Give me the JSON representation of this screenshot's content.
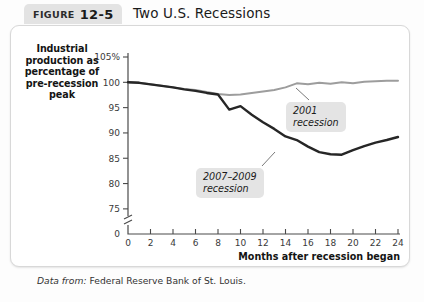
{
  "figure": {
    "word": "FIGURE",
    "number": "12-5",
    "title": "Two U.S. Recessions"
  },
  "source": {
    "prefix": "Data from:",
    "text": "Federal Reserve Bank of St. Louis."
  },
  "chart_data": {
    "type": "line",
    "title": "Two U.S. Recessions",
    "xlabel": "Months after recession began",
    "ylabel": "Industrial production as percentage of pre-recession peak",
    "xlim": [
      0,
      24
    ],
    "ylim": [
      73,
      106
    ],
    "xticks": [
      0,
      2,
      4,
      6,
      8,
      10,
      12,
      14,
      16,
      18,
      20,
      22,
      24
    ],
    "xticklabels": [
      "0",
      "2",
      "4",
      "6",
      "8",
      "10",
      "12",
      "14",
      "16",
      "18",
      "20",
      "22",
      "24"
    ],
    "yticks": [
      75,
      80,
      85,
      90,
      95,
      100,
      105
    ],
    "yticklabels": [
      "75",
      "80",
      "85",
      "90",
      "95",
      "100",
      "105%"
    ],
    "y_axis_break": true,
    "y_origin_label": "0",
    "grid": false,
    "legend_position": "inline-annotations",
    "series": [
      {
        "name": "2001 recession",
        "color": "#9d9d9d",
        "x": [
          0,
          1,
          2,
          3,
          4,
          5,
          6,
          7,
          8,
          9,
          10,
          11,
          12,
          13,
          14,
          15,
          16,
          17,
          18,
          19,
          20,
          21,
          22,
          23,
          24
        ],
        "values": [
          100.0,
          99.9,
          99.6,
          99.3,
          99.0,
          98.7,
          98.5,
          98.1,
          97.7,
          97.5,
          97.6,
          97.9,
          98.2,
          98.5,
          99.0,
          99.8,
          99.6,
          99.9,
          99.7,
          100.0,
          99.8,
          100.1,
          100.2,
          100.3,
          100.3
        ]
      },
      {
        "name": "2007–2009 recession",
        "color": "#262626",
        "x": [
          0,
          1,
          2,
          3,
          4,
          5,
          6,
          7,
          8,
          9,
          10,
          11,
          12,
          13,
          14,
          15,
          16,
          17,
          18,
          19,
          20,
          21,
          22,
          23,
          24
        ],
        "values": [
          100.0,
          99.9,
          99.6,
          99.3,
          99.0,
          98.6,
          98.3,
          97.9,
          97.6,
          94.6,
          95.3,
          93.6,
          92.1,
          90.8,
          89.3,
          88.6,
          87.3,
          86.2,
          85.8,
          85.7,
          86.6,
          87.4,
          88.1,
          88.6,
          89.2
        ]
      }
    ],
    "annotations": [
      {
        "id": "2001",
        "line1": "2001",
        "line2": "recession",
        "leader_from": [
          309,
          100
        ],
        "leader_to": [
          296,
          88
        ]
      },
      {
        "id": "2007-2009",
        "line1": "2007–2009",
        "line2": "recession",
        "leader_from": [
          262,
          166
        ],
        "leader_to": [
          275,
          152
        ]
      }
    ]
  }
}
